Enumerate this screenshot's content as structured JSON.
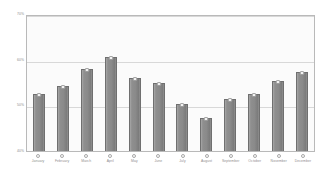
{
  "chart_data": {
    "type": "bar",
    "title": "",
    "xlabel": "",
    "ylabel": "",
    "ylim": [
      40,
      70
    ],
    "grid": true,
    "legend": "none",
    "ytick_labels": [
      "70%",
      "60%",
      "50%",
      "40%"
    ],
    "ytick_values": [
      70,
      60,
      50,
      40
    ],
    "categories": [
      "January",
      "February",
      "March",
      "April",
      "May",
      "June",
      "July",
      "August",
      "September",
      "October",
      "November",
      "December"
    ],
    "values": [
      52.5,
      54.3,
      58.0,
      60.5,
      56.0,
      54.8,
      50.2,
      47.2,
      51.3,
      52.5,
      55.3,
      57.3
    ],
    "series": [
      {
        "name": "",
        "values": [
          52.5,
          54.3,
          58.0,
          60.5,
          56.0,
          54.8,
          50.2,
          47.2,
          51.3,
          52.5,
          55.3,
          57.3
        ]
      }
    ]
  },
  "colors": {
    "bar_fill": "#8a8a8a",
    "bar_border": "#6f6f6f",
    "plot_background": "#fbfbfb",
    "gridline": "#d8d8d8",
    "frame_border": "#b9b9b9",
    "axis_text": "#8a8a8a",
    "page_background": "#ffffff"
  }
}
